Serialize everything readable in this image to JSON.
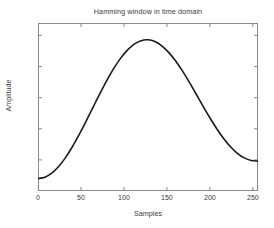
{
  "chart_data": {
    "type": "line",
    "title": "Hamming window in time domain",
    "xlabel": "Samples",
    "ylabel": "Amplitude",
    "xlim": [
      0,
      256
    ],
    "ylim": [
      0,
      1.08
    ],
    "grid": false,
    "legend": null,
    "xticks": [
      0,
      50,
      100,
      150,
      200,
      250
    ],
    "xtick_labels": [
      "0",
      "50",
      "100",
      "150",
      "200",
      "250"
    ],
    "yticks": [
      0,
      0.2,
      0.4,
      0.6,
      0.8,
      1
    ],
    "ytick_labels": [
      "0",
      "0.2",
      "0.4",
      "0.6",
      "0.8",
      "1"
    ],
    "series": [
      {
        "name": "Hamming window",
        "color": "#1a1a1a",
        "linewidth": 1.6,
        "x": [
          0,
          8,
          16,
          24,
          32,
          40,
          48,
          56,
          64,
          72,
          80,
          88,
          96,
          104,
          112,
          120,
          128,
          136,
          144,
          152,
          160,
          168,
          176,
          184,
          192,
          200,
          208,
          216,
          224,
          232,
          240,
          248,
          256
        ],
        "y": [
          0.08,
          0.0888,
          0.115,
          0.1575,
          0.2147,
          0.2843,
          0.3635,
          0.4492,
          0.5379,
          0.626,
          0.7099,
          0.7865,
          0.8526,
          0.9059,
          0.9443,
          0.9665,
          0.9719,
          0.9606,
          0.9333,
          0.8914,
          0.8369,
          0.7721,
          0.7,
          0.6236,
          0.5461,
          0.4707,
          0.4002,
          0.3374,
          0.2843,
          0.2425,
          0.2129,
          0.1961,
          0.1919
        ]
      }
    ]
  },
  "figure": {
    "background_color": "#ffffff",
    "axes_color": "#808080",
    "text_color": "#3a3a3a"
  }
}
